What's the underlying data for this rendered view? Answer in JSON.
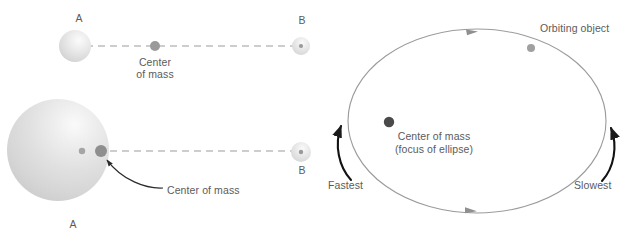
{
  "figure": {
    "panels": [
      {
        "name": "center-of-mass-panel",
        "cases": [
          {
            "name": "equal-masses",
            "body_a_label": "A",
            "body_b_label": "B",
            "center_of_mass_label_line1": "Center",
            "center_of_mass_label_line2": "of mass"
          },
          {
            "name": "unequal-masses",
            "body_a_label": "A",
            "body_b_label": "B",
            "center_of_mass_label": "Center of mass"
          }
        ]
      },
      {
        "name": "elliptical-orbit-panel",
        "orbiting_object_label": "Orbiting object",
        "focus_label_line1": "Center of mass",
        "focus_label_line2": "(focus of ellipse)",
        "fastest_label": "Fastest",
        "slowest_label": "Slowest"
      }
    ]
  },
  "colors": {
    "background": "#ffffff",
    "sphere_fill": "#d8d8d8",
    "sphere_highlight": "#f6f6f6",
    "dot_gray": "#9a9a9a",
    "dot_dark": "#4a4a4a",
    "dashed_line": "#bdbdbd",
    "orbit_line": "#9b9b9b",
    "arrow_black": "#1a1a1a",
    "text": "#5b5b5b"
  },
  "geometry": {
    "sphere_a_small": {
      "cx": 75,
      "cy": 46,
      "r": 16
    },
    "sphere_b_small_top": {
      "cx": 301,
      "cy": 46,
      "r": 9
    },
    "sphere_a_large": {
      "cx": 58,
      "cy": 150,
      "r": 51
    },
    "sphere_b_small_bottom": {
      "cx": 301,
      "cy": 152,
      "r": 10
    },
    "com_top": {
      "cx": 155,
      "cy": 46,
      "r": 5
    },
    "com_bottom": {
      "cx": 101,
      "cy": 151,
      "r": 6
    },
    "ellipse": {
      "cx": 477,
      "cy": 121,
      "rx": 129,
      "ry": 92
    },
    "orbiting_object": {
      "cx": 531,
      "cy": 48,
      "r": 4
    },
    "ellipse_focus": {
      "cx": 389,
      "cy": 122,
      "r": 5
    }
  }
}
